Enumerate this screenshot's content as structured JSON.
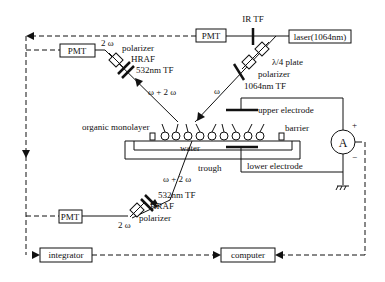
{
  "diagram": {
    "components": {
      "pmt_top_right": "PMT",
      "pmt_top_left": "PMT",
      "pmt_bottom": "PMT",
      "laser": "laser(1064nm)",
      "integrator": "integrator",
      "computer": "computer",
      "ammeter": "A"
    },
    "labels": {
      "ir_tf": "IR TF",
      "lambda_plate": "λ/4 plate",
      "polarizer_in": "polarizer",
      "tf_1064": "1064nm TF",
      "omega_in": "ω",
      "polarizer_top": "polarizer",
      "hraf_top": "HRAF",
      "tf_532_top": "532nm TF",
      "two_omega_top": "2 ω",
      "omega_plus_top": "ω + 2 ω",
      "upper_electrode": "upper electrode",
      "organic_monolayer": "organic monolayer",
      "barrier": "barrier",
      "water": "water",
      "trough": "trough",
      "lower_electrode": "lower electrode",
      "omega_plus_bottom": "ω + 2 ω",
      "tf_532_bottom": "532nm TF",
      "hraf_bottom": "HRAF",
      "polarizer_bottom": "polarizer",
      "two_omega_bottom": "2 ω",
      "plus": "+",
      "minus": "−"
    }
  }
}
